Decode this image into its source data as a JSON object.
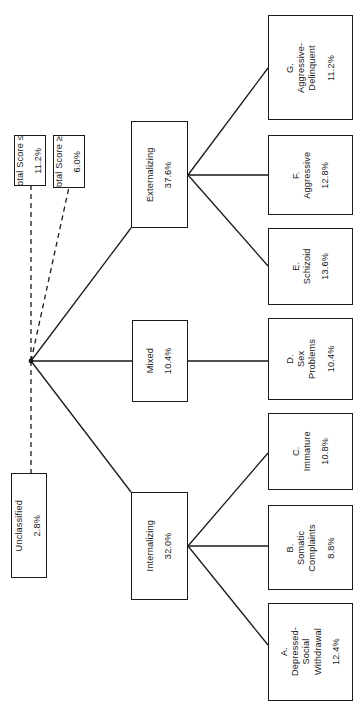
{
  "figure": {
    "type": "tree-diagram",
    "orientation": "rotated-90-ccw",
    "line_color": "#1a1a1a",
    "box_fill": "#ffffff"
  },
  "root": {
    "name": "junction-node",
    "label": ""
  },
  "criteria": [
    {
      "id": "total-score-low",
      "label": "Total Score ≤ 25",
      "percent": "11.2%",
      "link": "dashed"
    },
    {
      "id": "total-score-high",
      "label": "Total Score ≥ 100",
      "percent": "6.0%",
      "link": "dashed"
    },
    {
      "id": "unclassified",
      "label": "Unclassified",
      "percent": "2.8%",
      "link": "dashed"
    }
  ],
  "groups": [
    {
      "id": "externalizing",
      "label": "Externalizing",
      "percent": "37.6%",
      "link": "solid"
    },
    {
      "id": "mixed",
      "label": "Mixed",
      "percent": "10.4%",
      "link": "solid"
    },
    {
      "id": "internalizing",
      "label": "Internalizing",
      "percent": "32.0%",
      "link": "solid"
    }
  ],
  "syndromes": [
    {
      "id": "g-aggressive-delinquent",
      "letter": "G.",
      "line1": "Aggressive-",
      "line2": "Delinquent",
      "line3": "",
      "percent": "11.2%",
      "parent": "externalizing"
    },
    {
      "id": "f-aggressive",
      "letter": "F.",
      "line1": "Aggressive",
      "line2": "",
      "line3": "",
      "percent": "12.8%",
      "parent": "externalizing"
    },
    {
      "id": "e-schizoid",
      "letter": "E.",
      "line1": "Schizoid",
      "line2": "",
      "line3": "",
      "percent": "13.6%",
      "parent": "externalizing"
    },
    {
      "id": "d-sex-problems",
      "letter": "D.",
      "line1": "Sex",
      "line2": "Problems",
      "line3": "",
      "percent": "10.4%",
      "parent": "mixed"
    },
    {
      "id": "c-immature",
      "letter": "C.",
      "line1": "Immature",
      "line2": "",
      "line3": "",
      "percent": "10.8%",
      "parent": "internalizing"
    },
    {
      "id": "b-somatic-complaints",
      "letter": "B.",
      "line1": "Somatic",
      "line2": "Complaints",
      "line3": "",
      "percent": "8.8%",
      "parent": "internalizing"
    },
    {
      "id": "a-depressed-social-withdrawal",
      "letter": "A.",
      "line1": "Depressed-",
      "line2": "Social",
      "line3": "Withdrawal",
      "percent": "12.4%",
      "parent": "internalizing"
    }
  ]
}
